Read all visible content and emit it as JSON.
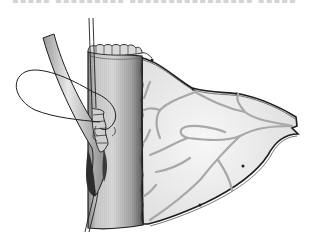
{
  "figure": {
    "caption_fragment": "▪▪▪▪▪ ▪▪▪▪▪▪▪▪▪ ▪▪▪▪▪▪▪▪▪▪▪▪▪▪▪▪ ▪▪▪▪▪▪▪▪▪▪▪▪",
    "elements": [
      "bowel-segment",
      "bowel-rim-sutures",
      "mesentery",
      "mesenteric-vessels",
      "inserted-tube",
      "suture-loop",
      "suture-threads"
    ],
    "colors": {
      "background": "#ffffff",
      "outline": "#1e1e1e",
      "bowel_light": "#e6e6e6",
      "bowel_mid": "#b4b4b4",
      "bowel_dark": "#6a6a6a",
      "mesentery_fill": "#f1f1f1",
      "vessel": "#a8a8a8"
    }
  }
}
